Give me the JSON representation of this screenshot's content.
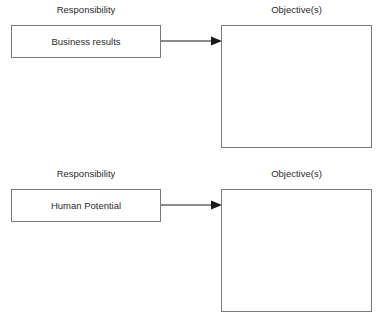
{
  "diagram": {
    "type": "flow",
    "orientation": "left-to-right",
    "background_color": "#ffffff",
    "border_color": "#7a7a7a",
    "text_color": "#2b2b2b",
    "arrow_color": "#1a1a1a",
    "sections": [
      {
        "id": "business-results",
        "responsibility_caption": "Responsibility",
        "objective_caption": "Objective(s)",
        "responsibility_label": "Business results",
        "objective_label": "",
        "arrow": "right-arrow-icon"
      },
      {
        "id": "human-potential",
        "responsibility_caption": "Responsibility",
        "objective_caption": "Objective(s)",
        "responsibility_label": "Human Potential",
        "objective_label": "",
        "arrow": "right-arrow-icon"
      }
    ]
  }
}
